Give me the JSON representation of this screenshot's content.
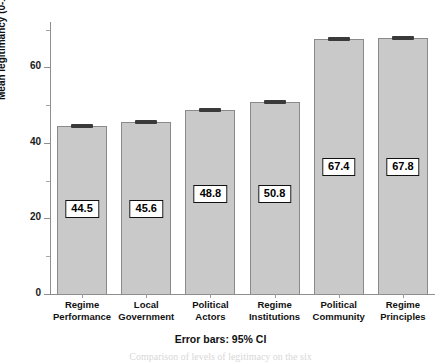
{
  "chart_data": {
    "type": "bar",
    "title": "",
    "subtitle": "",
    "xlabel": "",
    "ylabel": "Mean legitimancy (0-100)",
    "categories": [
      "Regime Performance",
      "Local Government",
      "Political Actors",
      "Regime Institutions",
      "Political Community",
      "Regime Principles"
    ],
    "category_lines": [
      [
        "Regime",
        "Performance"
      ],
      [
        "Local",
        "Government"
      ],
      [
        "Political",
        "Actors"
      ],
      [
        "Regime",
        "Institutions"
      ],
      [
        "Political",
        "Community"
      ],
      [
        "Regime",
        "Principles"
      ]
    ],
    "values": [
      44.5,
      45.6,
      48.8,
      50.8,
      67.4,
      67.8
    ],
    "value_labels": [
      "44.5",
      "45.6",
      "48.8",
      "50.8",
      "67.4",
      "67.8"
    ],
    "ylim": [
      0,
      72
    ],
    "ytick_labels": [
      "0",
      "20",
      "40",
      "60"
    ],
    "ytick_values": [
      0,
      20,
      40,
      60
    ],
    "yminor_values": [
      10,
      30,
      50,
      70
    ],
    "grid": false,
    "legend": "none",
    "error_bars": "95% CI",
    "bar_color": "#c9c9c9",
    "bar_edge_color": "#8a8a8a",
    "error_bar_color": "#3a3a3a",
    "axis_color": "#8e8e8e",
    "label_box_border": "#111111",
    "label_box_fill": "#ffffff"
  },
  "annotations": {
    "footnote": "Error bars: 95% CI",
    "caption_ghost": "Comparison of levels of legitimacy on the six"
  }
}
